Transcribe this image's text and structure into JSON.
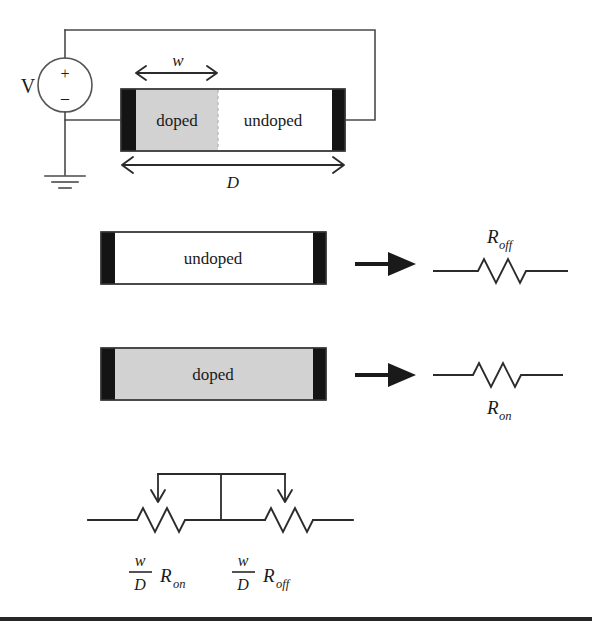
{
  "figure": {
    "colors": {
      "electrode": "#141414",
      "doped_gray": "#d2d2d2",
      "undoped_white": "#ffffff",
      "wire": "#4a4a4a",
      "ink": "#1a1a1a"
    }
  },
  "circuit": {
    "source_label": "V",
    "plus_sign": "+",
    "minus_sign": "–",
    "ground_name": "ground-symbol"
  },
  "device": {
    "doped_label": "doped",
    "undoped_label": "undoped",
    "dimension_w": "w",
    "dimension_D": "D"
  },
  "row_undoped": {
    "box_label": "undoped",
    "arrow_name": "implies-arrow",
    "resistor_label_base": "R",
    "resistor_label_sub": "off",
    "resistor_label_full": "R_off"
  },
  "row_doped": {
    "box_label": "doped",
    "arrow_name": "implies-arrow",
    "resistor_label_base": "R",
    "resistor_label_sub": "on",
    "resistor_label_full": "R_on"
  },
  "equivalent_circuit": {
    "left": {
      "numerator": "w",
      "denominator": "D",
      "resistor_base": "R",
      "resistor_sub": "on",
      "expression": "(w/D) R_on"
    },
    "right": {
      "numerator": "w",
      "denominator": "D",
      "resistor_base": "R",
      "resistor_sub": "off",
      "expression": "(w/D) R_off"
    }
  }
}
